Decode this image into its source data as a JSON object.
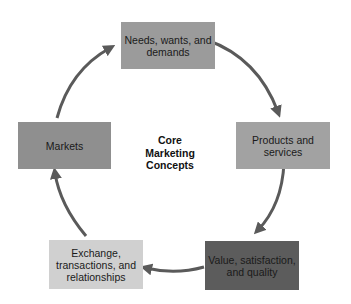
{
  "diagram": {
    "type": "cycle",
    "center_title": "Core Marketing Concepts",
    "center_lines": [
      "Core",
      "Marketing",
      "Concepts"
    ],
    "nodes": [
      {
        "id": "needs",
        "label": "Needs, wants, and demands",
        "color": "#9b9b9b"
      },
      {
        "id": "products",
        "label": "Products and services",
        "color": "#a2a2a2"
      },
      {
        "id": "value",
        "label": "Value, satisfaction, and quality",
        "color": "#5c5c5c"
      },
      {
        "id": "exchange",
        "label": "Exchange, transactions, and relationships",
        "color": "#d0d0d0"
      },
      {
        "id": "markets",
        "label": "Markets",
        "color": "#8f8f8f"
      }
    ],
    "edges": [
      {
        "from": "needs",
        "to": "products"
      },
      {
        "from": "products",
        "to": "value"
      },
      {
        "from": "value",
        "to": "exchange"
      },
      {
        "from": "exchange",
        "to": "markets"
      },
      {
        "from": "markets",
        "to": "needs"
      }
    ],
    "arrow_color": "#5a5a5a"
  }
}
